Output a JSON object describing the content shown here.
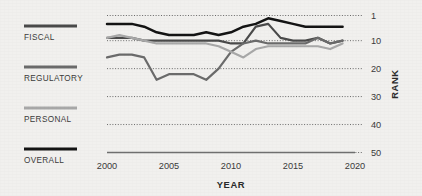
{
  "figure": {
    "background_color": "#f1f0ee",
    "text_color": "#3b3b3b"
  },
  "legend": {
    "position": "left",
    "items": [
      {
        "label": "FISCAL",
        "color": "#4a4a4a",
        "swatch_name": "legend-swatch-fiscal"
      },
      {
        "label": "REGULATORY",
        "color": "#6b6b6b",
        "swatch_name": "legend-swatch-regulatory"
      },
      {
        "label": "PERSONAL",
        "color": "#a8a8a8",
        "swatch_name": "legend-swatch-personal"
      },
      {
        "label": "OVERALL",
        "color": "#141414",
        "swatch_name": "legend-swatch-overall"
      }
    ]
  },
  "axes": {
    "x": {
      "title": "YEAR",
      "ticks": [
        "2000",
        "2005",
        "2010",
        "2015",
        "2020"
      ],
      "min": 2000,
      "max": 2020
    },
    "y": {
      "title": "RANK",
      "ticks": [
        "1",
        "10",
        "20",
        "30",
        "40",
        "50"
      ],
      "min": 1,
      "max": 50,
      "inverted": true
    }
  },
  "chart_data": {
    "type": "line",
    "title": "",
    "xlabel": "YEAR",
    "ylabel": "RANK",
    "xlim": [
      2000,
      2020
    ],
    "ylim": [
      1,
      50
    ],
    "y_inverted": true,
    "grid": "horizontal-dotted",
    "legend_position": "left",
    "x": [
      2000,
      2001,
      2002,
      2003,
      2004,
      2005,
      2006,
      2007,
      2008,
      2009,
      2010,
      2011,
      2012,
      2013,
      2014,
      2015,
      2016,
      2017,
      2018,
      2019
    ],
    "series": [
      {
        "name": "OVERALL",
        "color": "#141414",
        "values": [
          4,
          4,
          4,
          5,
          7,
          8,
          8,
          8,
          7,
          8,
          7,
          5,
          4,
          2,
          3,
          4,
          5,
          5,
          5,
          5
        ]
      },
      {
        "name": "FISCAL",
        "color": "#4a4a4a",
        "values": [
          9,
          9,
          9,
          10,
          10,
          10,
          10,
          10,
          10,
          10,
          11,
          11,
          5,
          4,
          9,
          10,
          10,
          9,
          11,
          10
        ]
      },
      {
        "name": "REGULATORY",
        "color": "#6b6b6b",
        "values": [
          16,
          15,
          15,
          16,
          24,
          22,
          22,
          22,
          24,
          20,
          14,
          11,
          10,
          11,
          11,
          11,
          11,
          9,
          11,
          10
        ]
      },
      {
        "name": "PERSONAL",
        "color": "#a8a8a8",
        "values": [
          9,
          8,
          9,
          10,
          11,
          11,
          11,
          11,
          11,
          12,
          14,
          16,
          13,
          12,
          12,
          12,
          12,
          12,
          13,
          11
        ]
      }
    ]
  }
}
